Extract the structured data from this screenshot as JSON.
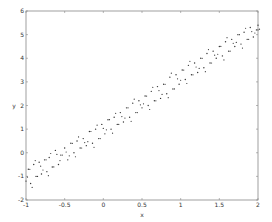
{
  "chart_data": {
    "type": "scatter",
    "title": "",
    "xlabel": "x",
    "ylabel": "y",
    "xlim": [
      -1,
      2
    ],
    "ylim": [
      -2,
      6
    ],
    "xticks": [
      -1,
      -0.5,
      0,
      0.5,
      1,
      1.5,
      2
    ],
    "xtick_labels": [
      "-1",
      "-0.5",
      "0",
      "0.5",
      "1",
      "1.5",
      "2"
    ],
    "yticks": [
      -2,
      -1,
      0,
      1,
      2,
      3,
      4,
      5,
      6
    ],
    "ytick_labels": [
      "-2",
      "-1",
      "0",
      "1",
      "2",
      "3",
      "4",
      "5",
      "6"
    ],
    "grid": false,
    "legend": null,
    "trend": "y ≈ 2x + 1 with noise",
    "marker_color": "#333333",
    "series": [
      {
        "name": "data",
        "x": [
          -1.0,
          -0.97,
          -0.94,
          -0.9,
          -0.87,
          -0.83,
          -0.8,
          -0.76,
          -0.73,
          -0.7,
          -0.66,
          -0.62,
          -0.58,
          -0.55,
          -0.5,
          -0.46,
          -0.42,
          -0.38,
          -0.34,
          -0.3,
          -0.26,
          -0.22,
          -0.18,
          -0.14,
          -0.1,
          -0.06,
          -0.02,
          0.02,
          0.06,
          0.1,
          0.14,
          0.18,
          0.22,
          0.26,
          0.3,
          0.34,
          0.38,
          0.42,
          0.46,
          0.5,
          0.54,
          0.58,
          0.62,
          0.66,
          0.7,
          0.74,
          0.78,
          0.82,
          0.86,
          0.9,
          0.94,
          0.98,
          1.02,
          1.06,
          1.1,
          1.14,
          1.18,
          1.22,
          1.26,
          1.3,
          1.34,
          1.38,
          1.42,
          1.46,
          1.5,
          1.54,
          1.58,
          1.62,
          1.66,
          1.7,
          1.74,
          1.78,
          1.82,
          1.86,
          1.9,
          1.94,
          1.98,
          2.0
        ],
        "y": [
          -1.2,
          -0.7,
          -1.3,
          -0.5,
          -1.0,
          -0.4,
          -0.9,
          -0.3,
          -0.8,
          -0.2,
          -0.6,
          0.1,
          -0.5,
          -0.1,
          0.2,
          -0.3,
          0.4,
          0.0,
          0.5,
          0.2,
          0.6,
          0.3,
          0.9,
          0.4,
          1.0,
          0.6,
          1.2,
          0.8,
          1.4,
          1.0,
          1.5,
          1.2,
          1.7,
          1.3,
          1.9,
          1.5,
          2.1,
          1.7,
          2.2,
          1.9,
          2.4,
          2.0,
          2.6,
          2.2,
          2.8,
          2.3,
          2.9,
          2.5,
          3.2,
          2.7,
          3.3,
          2.9,
          3.5,
          3.1,
          3.7,
          3.3,
          3.8,
          3.4,
          4.0,
          3.6,
          4.2,
          3.8,
          4.3,
          4.0,
          4.5,
          4.1,
          4.7,
          4.3,
          4.8,
          4.5,
          5.0,
          4.6,
          5.1,
          4.8,
          5.3,
          4.9,
          5.2,
          5.4
        ]
      }
    ]
  }
}
